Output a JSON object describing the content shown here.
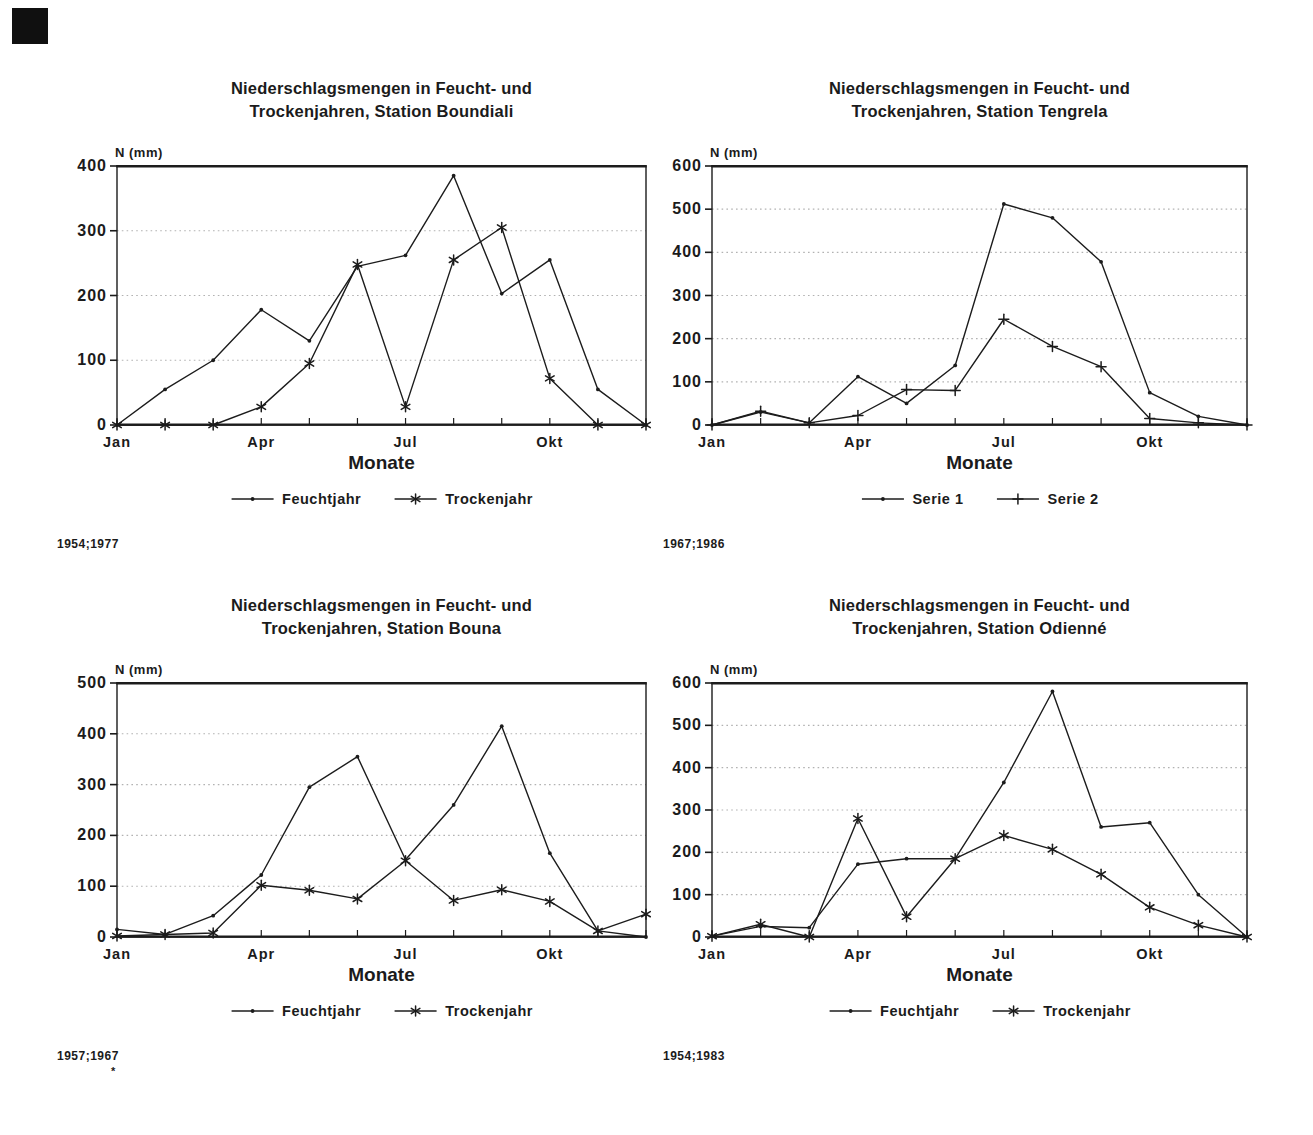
{
  "page": {
    "bg": "#ffffff",
    "ink": "#1c1c1c",
    "grid_color": "#b2b2b2"
  },
  "chart_data": [
    {
      "station": "Boundiali",
      "type": "line",
      "title": [
        "Niederschlagsmengen in Feucht- und",
        "Trockenjahren, Station Boundiali"
      ],
      "ylabel": "N (mm)",
      "xlabel": "Monate",
      "ylim": [
        0,
        400
      ],
      "ytick_step": 100,
      "ytick_labels": [
        "400",
        "300",
        "200",
        "100",
        "0"
      ],
      "xtick_labels": [
        {
          "month_index": 0,
          "label": "Jan"
        },
        {
          "month_index": 3,
          "label": "Apr"
        },
        {
          "month_index": 6,
          "label": "Jul"
        },
        {
          "month_index": 9,
          "label": "Okt"
        }
      ],
      "n_points": 12,
      "grid": "dotted-horizontal",
      "legend_position": "bottom",
      "series": [
        {
          "name": "Feuchtjahr",
          "marker": "dot",
          "values": [
            0,
            55,
            100,
            178,
            130,
            245,
            262,
            385,
            203,
            255,
            55,
            0
          ]
        },
        {
          "name": "Trockenjahr",
          "marker": "asterisk",
          "values": [
            0,
            0,
            0,
            28,
            95,
            248,
            28,
            255,
            305,
            72,
            0,
            0
          ]
        }
      ],
      "caption": "1954;1977",
      "footnote": ""
    },
    {
      "station": "Tengrela",
      "type": "line",
      "title": [
        "Niederschlagsmengen in Feucht- und",
        "Trockenjahren, Station Tengrela"
      ],
      "ylabel": "N (mm)",
      "xlabel": "Monate",
      "ylim": [
        0,
        600
      ],
      "ytick_step": 100,
      "ytick_labels": [
        "600",
        "500",
        "400",
        "300",
        "200",
        "100",
        "0"
      ],
      "xtick_labels": [
        {
          "month_index": 0,
          "label": "Jan"
        },
        {
          "month_index": 3,
          "label": "Apr"
        },
        {
          "month_index": 6,
          "label": "Jul"
        },
        {
          "month_index": 9,
          "label": "Okt"
        }
      ],
      "n_points": 12,
      "grid": "dotted-horizontal",
      "legend_position": "bottom",
      "series": [
        {
          "name": "Serie 1",
          "marker": "dot",
          "values": [
            0,
            30,
            5,
            112,
            50,
            138,
            512,
            480,
            378,
            75,
            20,
            0
          ]
        },
        {
          "name": "Serie 2",
          "marker": "plus",
          "values": [
            0,
            32,
            5,
            22,
            82,
            80,
            245,
            182,
            135,
            15,
            5,
            0
          ]
        }
      ],
      "caption": "1967;1986",
      "footnote": ""
    },
    {
      "station": "Bouna",
      "type": "line",
      "title": [
        "Niederschlagsmengen in Feucht- und",
        "Trockenjahren, Station Bouna"
      ],
      "ylabel": "N (mm)",
      "xlabel": "Monate",
      "ylim": [
        0,
        500
      ],
      "ytick_step": 100,
      "ytick_labels": [
        "500",
        "400",
        "300",
        "200",
        "100",
        "0"
      ],
      "xtick_labels": [
        {
          "month_index": 0,
          "label": "Jan"
        },
        {
          "month_index": 3,
          "label": "Apr"
        },
        {
          "month_index": 6,
          "label": "Jul"
        },
        {
          "month_index": 9,
          "label": "Okt"
        }
      ],
      "n_points": 12,
      "grid": "dotted-horizontal",
      "legend_position": "bottom",
      "series": [
        {
          "name": "Feuchtjahr",
          "marker": "dot",
          "values": [
            15,
            5,
            42,
            122,
            295,
            355,
            152,
            260,
            415,
            165,
            12,
            0
          ]
        },
        {
          "name": "Trockenjahr",
          "marker": "asterisk",
          "values": [
            2,
            5,
            8,
            102,
            92,
            75,
            150,
            72,
            93,
            70,
            12,
            45
          ]
        }
      ],
      "caption": "1957;1967",
      "footnote": "*"
    },
    {
      "station": "Odienné",
      "type": "line",
      "title": [
        "Niederschlagsmengen in Feucht- und",
        "Trockenjahren, Station Odienné"
      ],
      "ylabel": "N (mm)",
      "xlabel": "Monate",
      "ylim": [
        0,
        600
      ],
      "ytick_step": 100,
      "ytick_labels": [
        "600",
        "500",
        "400",
        "300",
        "200",
        "100",
        "0"
      ],
      "xtick_labels": [
        {
          "month_index": 0,
          "label": "Jan"
        },
        {
          "month_index": 3,
          "label": "Apr"
        },
        {
          "month_index": 6,
          "label": "Jul"
        },
        {
          "month_index": 9,
          "label": "Okt"
        }
      ],
      "n_points": 12,
      "grid": "dotted-horizontal",
      "legend_position": "bottom",
      "series": [
        {
          "name": "Feuchtjahr",
          "marker": "dot",
          "values": [
            2,
            25,
            22,
            172,
            185,
            185,
            365,
            580,
            260,
            270,
            100,
            0
          ]
        },
        {
          "name": "Trockenjahr",
          "marker": "asterisk",
          "values": [
            2,
            30,
            0,
            280,
            48,
            185,
            240,
            207,
            148,
            70,
            28,
            0
          ]
        }
      ],
      "caption": "1954;1983",
      "footnote": ""
    }
  ]
}
